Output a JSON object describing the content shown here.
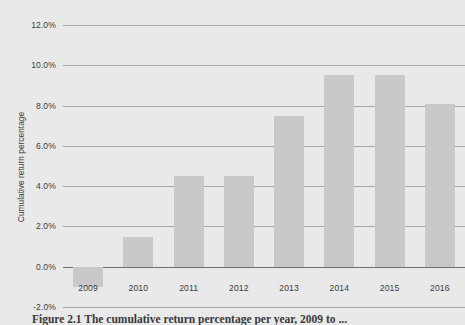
{
  "figure": {
    "background_color": "#e9e9e9",
    "bar_color": "#c9c9c9",
    "gridline_color": "#a6a6a6",
    "zero_line_color": "#6f6f6f",
    "caption": "Figure 2.1 The cumulative return percentage per year, 2009 to ..."
  },
  "chart_data": {
    "type": "bar",
    "title": "",
    "xlabel": "",
    "ylabel": "Cumulative return percentage",
    "categories": [
      "2009",
      "2010",
      "2011",
      "2012",
      "2013",
      "2014",
      "2015",
      "2016"
    ],
    "values": [
      -1.0,
      1.5,
      4.5,
      4.5,
      7.5,
      9.5,
      9.5,
      8.1
    ],
    "ylim": [
      -2.0,
      12.0
    ],
    "ytick_values": [
      12.0,
      10.0,
      8.0,
      6.0,
      4.0,
      2.0,
      0.0,
      -2.0
    ],
    "ytick_labels": [
      "12.0%",
      "10.0%",
      "8.0%",
      "6.0%",
      "4.0%",
      "2.0%",
      "0.0%",
      "-2.0%"
    ],
    "grid": true,
    "legend": false,
    "orientation": "vertical",
    "highlighted_category": "2009"
  }
}
